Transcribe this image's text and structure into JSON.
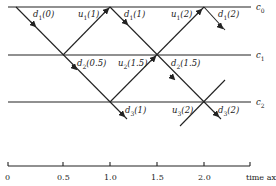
{
  "lines": [
    {
      "id": "c0",
      "label": "c",
      "sub": "0",
      "y": 7
    },
    {
      "id": "c1",
      "label": "c",
      "sub": "1",
      "y": 55
    },
    {
      "id": "c2",
      "label": "c",
      "sub": "2",
      "y": 102
    }
  ],
  "signals": [
    {
      "name": "d",
      "sub": "1",
      "arg": "(0)",
      "x": 33,
      "y": 9
    },
    {
      "name": "u",
      "sub": "1",
      "arg": "(1)",
      "x": 79,
      "y": 9
    },
    {
      "name": "d",
      "sub": "1",
      "arg": "(1)",
      "x": 124,
      "y": 9
    },
    {
      "name": "u",
      "sub": "1",
      "arg": "(2)",
      "x": 171,
      "y": 9
    },
    {
      "name": "d",
      "sub": "1",
      "arg": "(2)",
      "x": 218,
      "y": 9
    },
    {
      "name": "d",
      "sub": "2",
      "arg": "(0.5)",
      "x": 77,
      "y": 57
    },
    {
      "name": "u",
      "sub": "2",
      "arg": "(1.5)",
      "x": 119,
      "y": 57
    },
    {
      "name": "d",
      "sub": "2",
      "arg": "(1.5)",
      "x": 171,
      "y": 57
    },
    {
      "name": "d",
      "sub": "3",
      "arg": "(1)",
      "x": 125,
      "y": 104
    },
    {
      "name": "u",
      "sub": "3",
      "arg": "(2)",
      "x": 172,
      "y": 104
    },
    {
      "name": "d",
      "sub": "3",
      "arg": "(2)",
      "x": 218,
      "y": 104
    }
  ],
  "axis": {
    "label": "time axis",
    "ticks": [
      {
        "label": "0",
        "x": 8
      },
      {
        "label": "0.5",
        "x": 63
      },
      {
        "label": "1.0",
        "x": 110
      },
      {
        "label": "1.5",
        "x": 157
      },
      {
        "label": "2.0",
        "x": 204
      }
    ],
    "end_x": 250
  }
}
